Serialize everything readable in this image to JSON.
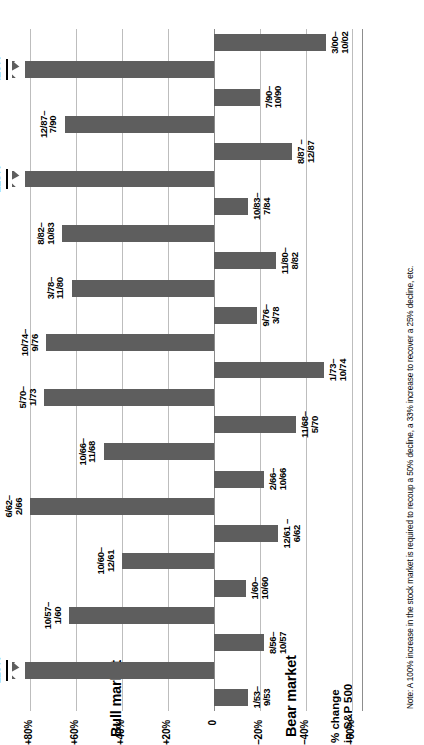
{
  "chart_data": {
    "type": "bar",
    "title": "",
    "xlabel": "",
    "ylabel": "% change in S&P 500",
    "axis_title_line1": "% change",
    "axis_title_line2": "in S&P 500",
    "orientation": "horizontal-diverging",
    "ylim": [
      -60,
      80
    ],
    "axis_min_drawn": -65,
    "axis_max_drawn": 88,
    "grid": true,
    "tick_values": [
      80,
      60,
      40,
      20,
      0,
      -20,
      -40,
      -60
    ],
    "tick_labels": [
      "+80%",
      "+60%",
      "+40%",
      "+20%",
      "0",
      "–20%",
      "–40%",
      "–60%"
    ],
    "section_labels": {
      "positive": "Bull market",
      "negative": "Bear market"
    },
    "series": [
      {
        "name": "Bull market",
        "color": "#5e5e5e"
      },
      {
        "name": "Bear market",
        "color": "#5e5e5e"
      }
    ],
    "bars": [
      {
        "period": "1/53–\n9/53",
        "label_line1": "1/53–",
        "label_line2": "9/53",
        "value": -15,
        "side": "bear",
        "broken": false,
        "value_label": ""
      },
      {
        "period": "9/53–\n8/56",
        "label_line1": "9/53–",
        "label_line2": "8/56",
        "value": 119,
        "side": "bull",
        "broken": true,
        "value_label": "119%"
      },
      {
        "period": "8/56–\n10/57",
        "label_line1": "8/56–",
        "label_line2": "10/57",
        "value": -22,
        "side": "bear",
        "broken": false,
        "value_label": ""
      },
      {
        "period": "10/57–\n1/60",
        "label_line1": "10/57–",
        "label_line2": "1/60",
        "value": 63,
        "side": "bull",
        "broken": false,
        "value_label": ""
      },
      {
        "period": "1/60–\n10/60",
        "label_line1": "1/60–",
        "label_line2": "10/60",
        "value": -14,
        "side": "bear",
        "broken": false,
        "value_label": ""
      },
      {
        "period": "10/60–\n12/61",
        "label_line1": "10/60–",
        "label_line2": "12/61",
        "value": 40,
        "side": "bull",
        "broken": false,
        "value_label": ""
      },
      {
        "period": "12/61–\n6/62",
        "label_line1": "12/61 –",
        "label_line2": "6/62",
        "value": -28,
        "side": "bear",
        "broken": false,
        "value_label": ""
      },
      {
        "period": "6/62–\n2/66",
        "label_line1": "6/62–",
        "label_line2": "2/66",
        "value": 80,
        "side": "bull",
        "broken": false,
        "value_label": ""
      },
      {
        "period": "2/66–\n10/66",
        "label_line1": "2/66–",
        "label_line2": "10/66",
        "value": -22,
        "side": "bear",
        "broken": false,
        "value_label": ""
      },
      {
        "period": "10/66–\n11/68",
        "label_line1": "10/66–",
        "label_line2": "11/68",
        "value": 48,
        "side": "bull",
        "broken": false,
        "value_label": ""
      },
      {
        "period": "11/68–\n5/70",
        "label_line1": "11/68–",
        "label_line2": "5/70",
        "value": -36,
        "side": "bear",
        "broken": false,
        "value_label": ""
      },
      {
        "period": "5/70–\n1/73",
        "label_line1": "5/70–",
        "label_line2": "1/73",
        "value": 74,
        "side": "bull",
        "broken": false,
        "value_label": ""
      },
      {
        "period": "1/73–\n10/74",
        "label_line1": "1/73–",
        "label_line2": "10/74",
        "value": -48,
        "side": "bear",
        "broken": false,
        "value_label": ""
      },
      {
        "period": "10/74–\n9/76",
        "label_line1": "10/74–",
        "label_line2": "9/76",
        "value": 73,
        "side": "bull",
        "broken": false,
        "value_label": ""
      },
      {
        "period": "9/76–\n3/78",
        "label_line1": "9/76–",
        "label_line2": "3/78",
        "value": -19,
        "side": "bear",
        "broken": false,
        "value_label": ""
      },
      {
        "period": "3/78–\n11/80",
        "label_line1": "3/78–",
        "label_line2": "11/80",
        "value": 62,
        "side": "bull",
        "broken": false,
        "value_label": ""
      },
      {
        "period": "11/80–\n8/82",
        "label_line1": "11/80–",
        "label_line2": "8/82",
        "value": -27,
        "side": "bear",
        "broken": false,
        "value_label": ""
      },
      {
        "period": "8/82–\n10/83",
        "label_line1": "8/82–",
        "label_line2": "10/83",
        "value": 66,
        "side": "bull",
        "broken": false,
        "value_label": ""
      },
      {
        "period": "10/83–\n7/84",
        "label_line1": "10/83–",
        "label_line2": "7/84",
        "value": -15,
        "side": "bear",
        "broken": false,
        "value_label": ""
      },
      {
        "period": "7/84–\n8/87",
        "label_line1": "7/84–",
        "label_line2": "8/87",
        "value": 128,
        "side": "bull",
        "broken": true,
        "value_label": "128%"
      },
      {
        "period": "8/87–\n12/87",
        "label_line1": "8/87 –",
        "label_line2": "12/87",
        "value": -34,
        "side": "bear",
        "broken": false,
        "value_label": ""
      },
      {
        "period": "12/87–\n7/90",
        "label_line1": "12/87–",
        "label_line2": "7/90",
        "value": 65,
        "side": "bull",
        "broken": false,
        "value_label": ""
      },
      {
        "period": "7/90–\n10/90",
        "label_line1": "7/90–",
        "label_line2": "10/90",
        "value": -20,
        "side": "bear",
        "broken": false,
        "value_label": ""
      },
      {
        "period": "10/90–\n3/00",
        "label_line1": "10/90–",
        "label_line2": "3/00",
        "value": 420,
        "side": "bull",
        "broken": true,
        "value_label": "420%"
      },
      {
        "period": "3/00–\n10/02",
        "label_line1": "3/00–",
        "label_line2": "10/02",
        "value": -49,
        "side": "bear",
        "broken": false,
        "value_label": ""
      }
    ],
    "annotations": [
      {
        "text": "420%",
        "for": "10/90–3/00"
      },
      {
        "text": "128%",
        "for": "7/84–8/87"
      },
      {
        "text": "119%",
        "for": "9/53–8/56"
      }
    ],
    "footnote": "Note: A 100% increase in the stock market is required to recoup a 50% decline, a 33% increase to recover a 25% decline, etc."
  }
}
